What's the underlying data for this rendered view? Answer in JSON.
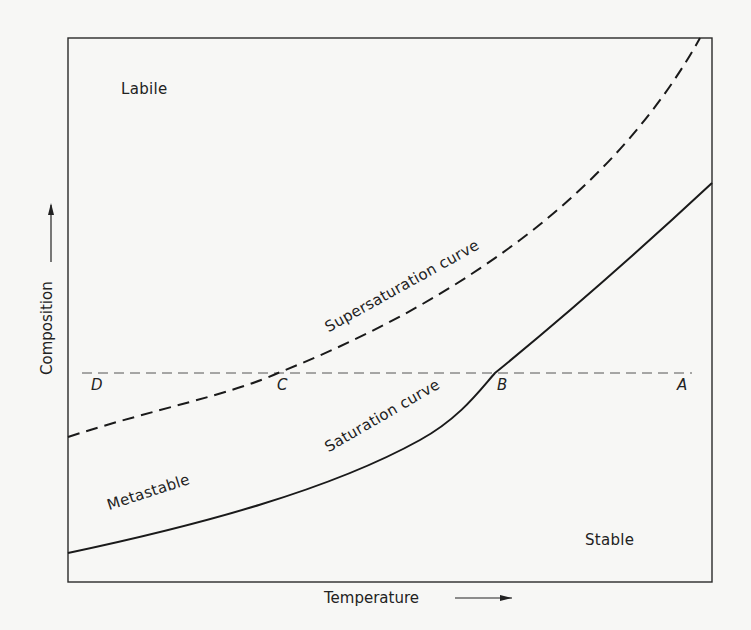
{
  "diagram": {
    "type": "solubility-supersolubility diagram",
    "x_axis": {
      "label": "Temperature",
      "arrow": "right-arrow"
    },
    "y_axis": {
      "label": "Composition",
      "arrow": "up-arrow"
    },
    "regions": {
      "labile": "Labile",
      "metastable": "Metastable",
      "stable": "Stable"
    },
    "curves": {
      "supersaturation": {
        "label": "Supersaturation curve",
        "style": "dashed"
      },
      "saturation": {
        "label": "Saturation curve",
        "style": "solid"
      }
    },
    "cooling_line": {
      "style": "dashed",
      "points": [
        "D",
        "C",
        "B",
        "A"
      ]
    },
    "points": {
      "A": "A",
      "B": "B",
      "C": "C",
      "D": "D"
    }
  }
}
